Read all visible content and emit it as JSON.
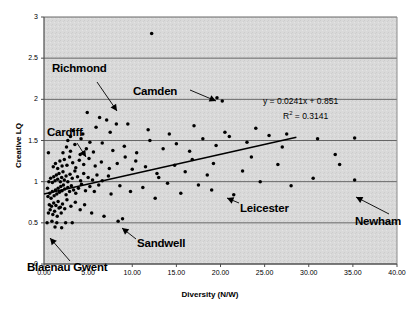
{
  "chart_data": {
    "type": "scatter",
    "title": "",
    "xlabel": "Diversity (N/W)",
    "ylabel": "Creative LQ",
    "xlim": [
      0,
      40
    ],
    "ylim": [
      0,
      3
    ],
    "xticks": [
      "0.00",
      "5.00",
      "10.00",
      "15.00",
      "20.00",
      "25.00",
      "30.00",
      "35.00",
      "40.00"
    ],
    "xtick_values": [
      0,
      5,
      10,
      15,
      20,
      25,
      30,
      35,
      40
    ],
    "yticks": [
      "0",
      "0.5",
      "1",
      "1.5",
      "2",
      "2.5",
      "3"
    ],
    "ytick_values": [
      0,
      0.5,
      1,
      1.5,
      2,
      2.5,
      3
    ],
    "grid": "horizontal",
    "plot_background": "#d9d9d9",
    "marker_color": "#000000",
    "trendline": {
      "equation": "y = 0.0241x + 0.851",
      "r_squared_label": "R",
      "r_squared_sup": "2",
      "r_squared_value": " = 0.3141",
      "slope": 0.0241,
      "intercept": 0.851,
      "r2": 0.3141,
      "x_start": 0.0,
      "x_end": 28.6,
      "color": "#000000"
    },
    "annotations": [
      {
        "label": "Richmond",
        "lx": 52,
        "ly": 62,
        "ax": 97,
        "ay": 82,
        "tx": 117,
        "ty": 111
      },
      {
        "label": "Camden",
        "lx": 133,
        "ly": 85,
        "ax": 190,
        "ay": 90,
        "tx": 216,
        "ty": 101
      },
      {
        "label": "Cardiff",
        "lx": 47,
        "ly": 126,
        "ax": 77,
        "ay": 143,
        "tx": 86,
        "ty": 157
      },
      {
        "label": "Leicester",
        "lx": 240,
        "ly": 202,
        "ax": 239,
        "ay": 203,
        "tx": 227,
        "ty": 198
      },
      {
        "label": "Newham",
        "lx": 355,
        "ly": 215,
        "ax": 389,
        "ay": 214,
        "tx": 356,
        "ty": 197
      },
      {
        "label": "Sandwell",
        "lx": 137,
        "ly": 237,
        "ax": 136,
        "ay": 239,
        "tx": 122,
        "ty": 228
      },
      {
        "label": "Blaenau Gwent",
        "lx": 27,
        "ly": 261,
        "ax": 70,
        "ay": 261,
        "tx": 50,
        "ty": 238
      }
    ],
    "points": [
      [
        0.35,
        0.5
      ],
      [
        0.9,
        0.52
      ],
      [
        1.45,
        0.5
      ],
      [
        2.45,
        0.5
      ],
      [
        3.2,
        0.5
      ],
      [
        0.5,
        0.62
      ],
      [
        0.7,
        0.66
      ],
      [
        1.0,
        0.6
      ],
      [
        1.2,
        0.64
      ],
      [
        1.5,
        0.58
      ],
      [
        1.7,
        0.68
      ],
      [
        1.95,
        0.62
      ],
      [
        0.6,
        0.72
      ],
      [
        0.85,
        0.7
      ],
      [
        1.1,
        0.74
      ],
      [
        1.35,
        0.71
      ],
      [
        1.6,
        0.76
      ],
      [
        1.85,
        0.69
      ],
      [
        2.1,
        0.73
      ],
      [
        2.35,
        0.67
      ],
      [
        2.6,
        0.78
      ],
      [
        3.05,
        0.7
      ],
      [
        3.55,
        0.75
      ],
      [
        4.1,
        0.66
      ],
      [
        4.6,
        0.72
      ],
      [
        0.45,
        0.82
      ],
      [
        0.65,
        0.86
      ],
      [
        0.8,
        0.8
      ],
      [
        0.95,
        0.88
      ],
      [
        1.15,
        0.83
      ],
      [
        1.3,
        0.9
      ],
      [
        1.45,
        0.85
      ],
      [
        1.6,
        0.92
      ],
      [
        1.75,
        0.87
      ],
      [
        1.9,
        0.94
      ],
      [
        2.05,
        0.89
      ],
      [
        2.2,
        0.96
      ],
      [
        2.35,
        0.91
      ],
      [
        2.5,
        0.84
      ],
      [
        2.7,
        0.93
      ],
      [
        2.9,
        0.88
      ],
      [
        3.1,
        0.95
      ],
      [
        3.35,
        0.9
      ],
      [
        3.6,
        0.86
      ],
      [
        3.9,
        0.92
      ],
      [
        4.25,
        0.97
      ],
      [
        4.7,
        0.89
      ],
      [
        5.2,
        0.94
      ],
      [
        5.7,
        0.88
      ],
      [
        6.2,
        0.96
      ],
      [
        0.55,
        1.0
      ],
      [
        0.75,
        1.04
      ],
      [
        0.95,
        0.99
      ],
      [
        1.1,
        1.06
      ],
      [
        1.25,
        1.01
      ],
      [
        1.4,
        1.08
      ],
      [
        1.55,
        1.03
      ],
      [
        1.7,
        1.1
      ],
      [
        1.85,
        1.0
      ],
      [
        2.0,
        1.05
      ],
      [
        2.15,
        1.12
      ],
      [
        2.3,
        1.02
      ],
      [
        2.5,
        1.07
      ],
      [
        2.7,
        1.0
      ],
      [
        2.95,
        1.09
      ],
      [
        3.2,
        1.04
      ],
      [
        3.5,
        1.13
      ],
      [
        3.8,
        1.06
      ],
      [
        4.15,
        1.01
      ],
      [
        4.5,
        1.1
      ],
      [
        5.0,
        1.05
      ],
      [
        5.5,
        1.02
      ],
      [
        6.0,
        1.08
      ],
      [
        6.6,
        1.01
      ],
      [
        7.3,
        1.07
      ],
      [
        1.05,
        1.18
      ],
      [
        1.3,
        1.22
      ],
      [
        1.55,
        1.16
      ],
      [
        1.8,
        1.25
      ],
      [
        2.05,
        1.19
      ],
      [
        2.3,
        1.27
      ],
      [
        2.6,
        1.2
      ],
      [
        2.9,
        1.3
      ],
      [
        3.25,
        1.23
      ],
      [
        3.6,
        1.17
      ],
      [
        4.0,
        1.26
      ],
      [
        4.5,
        1.21
      ],
      [
        5.1,
        1.28
      ],
      [
        5.8,
        1.19
      ],
      [
        6.5,
        1.24
      ],
      [
        7.4,
        1.16
      ],
      [
        8.3,
        1.22
      ],
      [
        9.2,
        1.3
      ],
      [
        10.4,
        1.25
      ],
      [
        11.5,
        1.18
      ],
      [
        2.15,
        1.35
      ],
      [
        2.55,
        1.42
      ],
      [
        3.0,
        1.37
      ],
      [
        3.5,
        1.45
      ],
      [
        4.1,
        1.33
      ],
      [
        4.8,
        1.4
      ],
      [
        5.6,
        1.36
      ],
      [
        6.6,
        1.47
      ],
      [
        7.8,
        1.38
      ],
      [
        9.1,
        1.43
      ],
      [
        10.5,
        1.35
      ],
      [
        12.0,
        1.5
      ],
      [
        13.5,
        1.4
      ],
      [
        15.0,
        1.46
      ],
      [
        16.5,
        1.37
      ],
      [
        18.0,
        1.52
      ],
      [
        19.5,
        1.44
      ],
      [
        21.0,
        1.55
      ],
      [
        23.0,
        1.48
      ],
      [
        25.5,
        1.56
      ],
      [
        3.3,
        1.62
      ],
      [
        4.4,
        1.58
      ],
      [
        5.9,
        1.66
      ],
      [
        7.5,
        1.6
      ],
      [
        9.5,
        1.7
      ],
      [
        11.8,
        1.63
      ],
      [
        14.2,
        1.58
      ],
      [
        17.0,
        1.68
      ],
      [
        20.5,
        1.6
      ],
      [
        24.0,
        1.65
      ],
      [
        27.5,
        1.58
      ],
      [
        31.0,
        1.52
      ],
      [
        35.2,
        1.53
      ],
      [
        33.5,
        1.21
      ],
      [
        35.2,
        1.02
      ],
      [
        4.9,
        1.84
      ],
      [
        6.3,
        1.78
      ],
      [
        7.1,
        1.75
      ],
      [
        8.2,
        1.7
      ],
      [
        12.2,
        2.8
      ],
      [
        19.6,
        2.02
      ],
      [
        20.2,
        1.98
      ],
      [
        8.9,
        0.55
      ],
      [
        6.8,
        0.58
      ],
      [
        5.4,
        0.62
      ],
      [
        7.6,
        0.85
      ],
      [
        8.6,
        0.95
      ],
      [
        9.8,
        0.88
      ],
      [
        11.2,
        0.93
      ],
      [
        12.6,
        0.8
      ],
      [
        14.0,
        0.98
      ],
      [
        15.5,
        0.86
      ],
      [
        17.5,
        0.96
      ],
      [
        19.0,
        0.9
      ],
      [
        21.5,
        0.84
      ],
      [
        24.5,
        1.0
      ],
      [
        28.0,
        0.95
      ],
      [
        30.5,
        1.04
      ],
      [
        1.25,
        0.45
      ],
      [
        2.0,
        0.44
      ],
      [
        8.4,
        0.52
      ],
      [
        0.4,
        0.92
      ],
      [
        0.5,
        1.35
      ],
      [
        33.0,
        1.33
      ],
      [
        26.5,
        1.21
      ],
      [
        22.5,
        1.13
      ],
      [
        18.5,
        1.08
      ],
      [
        16.0,
        1.12
      ],
      [
        13.0,
        1.05
      ],
      [
        10.0,
        1.15
      ],
      [
        3.0,
        1.55
      ],
      [
        2.7,
        1.5
      ],
      [
        4.2,
        1.52
      ],
      [
        5.2,
        1.48
      ],
      [
        12.8,
        1.1
      ],
      [
        14.8,
        1.2
      ],
      [
        16.8,
        1.27
      ],
      [
        19.2,
        1.22
      ],
      [
        23.5,
        1.3
      ],
      [
        27.0,
        1.42
      ]
    ]
  }
}
